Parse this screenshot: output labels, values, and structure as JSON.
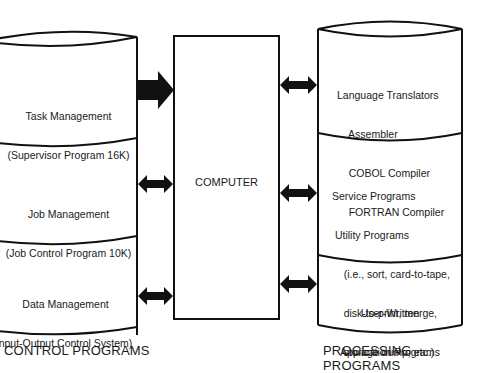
{
  "diagram": {
    "title": "",
    "center_block": {
      "label": "COMPUTER"
    },
    "control_programs": {
      "caption": "CONTROL PROGRAMS",
      "sections": [
        {
          "lines": [
            "Task Management",
            "(Supervisor Program 16K)"
          ],
          "connector": "one-way-arrow-to-computer"
        },
        {
          "lines": [
            "Job Management",
            "(Job Control Program 10K)"
          ],
          "connector": "two-way-arrow"
        },
        {
          "lines": [
            "Data Management",
            "nput-Output Control System)"
          ],
          "connector": "two-way-arrow"
        }
      ]
    },
    "processing_programs": {
      "caption": "PROCESSING PROGRAMS",
      "sections": [
        {
          "lines": [
            "Language Translators",
            "    Assembler",
            "    COBOL Compiler",
            "    FORTRAN Compiler"
          ],
          "connector": "two-way-arrow"
        },
        {
          "lines": [
            "Service Programs",
            " Utility Programs",
            "    (i.e., sort, card-to-tape,",
            "    disk-to-print, merge,",
            "    storage dump, etc.)"
          ],
          "connector": "two-way-arrow"
        },
        {
          "lines": [
            "User-Written",
            "Application Programs"
          ],
          "connector": "two-way-arrow"
        }
      ]
    },
    "colors": {
      "stroke": "#111111",
      "background": "#ffffff"
    }
  }
}
